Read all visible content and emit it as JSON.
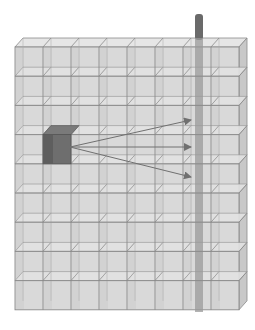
{
  "diagram": {
    "grid": {
      "columns": 8,
      "rows": 9,
      "origin_x": 15,
      "origin_y": 47,
      "cell_w": 28,
      "cell_h": 29.2,
      "depth_dx": 8,
      "depth_dy": -9
    },
    "highlighted_cube": {
      "column": 1,
      "row": 3,
      "color": "#6e6e6e"
    },
    "rod": {
      "x": 195,
      "width": 8,
      "top_y": 14,
      "bottom_y": 312,
      "color": "#6a6a6a"
    },
    "arrows": [
      {
        "from_x": 70,
        "from_y": 147,
        "to_x": 191,
        "to_y": 120
      },
      {
        "from_x": 70,
        "from_y": 147,
        "to_x": 191,
        "to_y": 147
      },
      {
        "from_x": 70,
        "from_y": 147,
        "to_x": 191,
        "to_y": 177
      }
    ],
    "colors": {
      "face": "#d9d9d9",
      "face_light": "#e3e3e3",
      "side": "#c8c8c8",
      "line": "#8a8a8a",
      "arrow": "#707070",
      "background": "#ffffff"
    }
  }
}
